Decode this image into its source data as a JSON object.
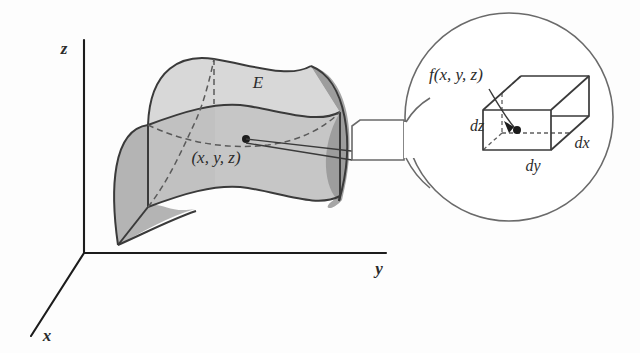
{
  "figure": {
    "background_color": "#fdfdfd",
    "ink_color": "#2b2b2b"
  },
  "axes": {
    "z_label": "z",
    "y_label": "y",
    "x_label": "x"
  },
  "solid": {
    "label": "E",
    "point_label": "(x, y, z)",
    "face_colors": {
      "top": "#d8d8d8",
      "front": "#c4c4c4",
      "left": "#aeaeae",
      "right": "#9f9f9f"
    }
  },
  "callout": {
    "function_label": "f(x, y, z)",
    "cube": {
      "dz_label": "dz",
      "dy_label": "dy",
      "dx_label": "dx"
    },
    "circle_fill": "#ffffff",
    "circle_stroke": "#6a6a6a"
  }
}
